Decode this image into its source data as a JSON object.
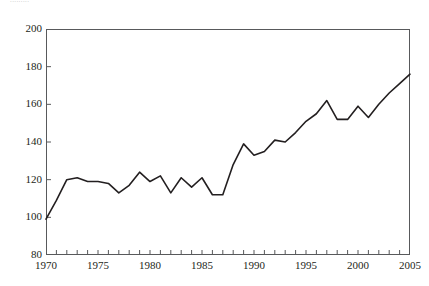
{
  "figure": {
    "top_note": "........."
  },
  "chart_data": {
    "type": "line",
    "title": "",
    "subtitle": "",
    "xlabel": "",
    "ylabel": "",
    "xlim": [
      1970,
      2005
    ],
    "ylim": [
      80,
      200
    ],
    "grid": false,
    "legend": null,
    "y_ticks": [
      80,
      100,
      120,
      140,
      160,
      180,
      200
    ],
    "y_tick_labels": [
      "80",
      "100",
      "120",
      "140",
      "160",
      "180",
      "200"
    ],
    "x_ticks": [
      1970,
      1971,
      1972,
      1973,
      1974,
      1975,
      1976,
      1977,
      1978,
      1979,
      1980,
      1981,
      1982,
      1983,
      1984,
      1985,
      1986,
      1987,
      1988,
      1989,
      1990,
      1991,
      1992,
      1993,
      1994,
      1995,
      1996,
      1997,
      1998,
      1999,
      2000,
      2001,
      2002,
      2003,
      2004,
      2005
    ],
    "x_tick_labels": [
      "1970",
      "1975",
      "1980",
      "1985",
      "1990",
      "1995",
      "2000",
      "2005"
    ],
    "x_labeled_ticks": [
      1970,
      1975,
      1980,
      1985,
      1990,
      1995,
      2000,
      2005
    ],
    "line_color": "#231f20",
    "line_width": 1.6,
    "x": [
      1970,
      1971,
      1972,
      1973,
      1974,
      1975,
      1976,
      1977,
      1978,
      1979,
      1980,
      1981,
      1982,
      1983,
      1984,
      1985,
      1986,
      1987,
      1988,
      1989,
      1990,
      1991,
      1992,
      1993,
      1994,
      1995,
      1996,
      1997,
      1998,
      1999,
      2000,
      2001,
      2002,
      2003,
      2004,
      2005
    ],
    "values": [
      99,
      109,
      120,
      121,
      119,
      119,
      118,
      113,
      117,
      124,
      119,
      122,
      113,
      121,
      116,
      121,
      112,
      112,
      128,
      139,
      133,
      135,
      141,
      140,
      145,
      151,
      155,
      162,
      152,
      152,
      159,
      153,
      160,
      166,
      171,
      176
    ],
    "series": [
      {
        "name": "index",
        "values": [
          99,
          109,
          120,
          121,
          119,
          119,
          118,
          113,
          117,
          124,
          119,
          122,
          113,
          121,
          116,
          121,
          112,
          112,
          128,
          139,
          133,
          135,
          141,
          140,
          145,
          151,
          155,
          162,
          152,
          152,
          159,
          153,
          160,
          166,
          171,
          176
        ]
      }
    ]
  }
}
